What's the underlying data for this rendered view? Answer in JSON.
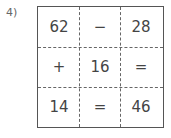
{
  "problem_label": "4)",
  "grid": {
    "rows": [
      [
        "62",
        "−",
        "28"
      ],
      [
        "+",
        "16",
        "="
      ],
      [
        "14",
        "=",
        "46"
      ]
    ]
  }
}
